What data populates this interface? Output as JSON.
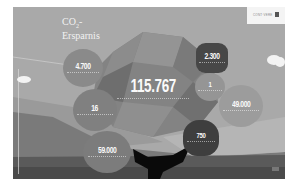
{
  "header": {
    "title_line1": "CO",
    "title_sub": "2",
    "title_suffix": "-",
    "title_line2": "Ersparnis",
    "logo_text": "CONT·VERE"
  },
  "center": {
    "value": "115.767"
  },
  "bubbles": [
    {
      "id": "top-left",
      "value": "4.700"
    },
    {
      "id": "mid-left",
      "value": "16"
    },
    {
      "id": "bottom-left",
      "value": "59.000"
    },
    {
      "id": "top-right",
      "value": "2.300"
    },
    {
      "id": "upper-right-small",
      "value": "1"
    },
    {
      "id": "right",
      "value": "49.000"
    },
    {
      "id": "bottom-right",
      "value": "750"
    }
  ],
  "colors": {
    "background": "#a8a8a8",
    "bubble_dark": "#4a4a4a",
    "bubble_mid": "#7d7d7d",
    "text": "#fafafa"
  }
}
